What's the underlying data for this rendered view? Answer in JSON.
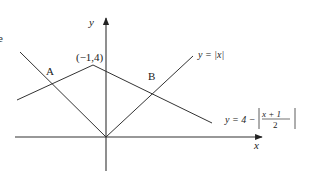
{
  "diagram": {
    "type": "function-graph",
    "axes": {
      "x_label": "x",
      "y_label": "y"
    },
    "points": {
      "A": "A",
      "B": "B",
      "peak": "(−1,4)"
    },
    "curves": [
      {
        "name": "abs-x",
        "label_prefix": "y = ",
        "label_expr": "|x|"
      },
      {
        "name": "tent",
        "label_prefix": "y = 4 − ",
        "numerator": "x + 1",
        "denominator": "2"
      }
    ],
    "edge_fragment": "e",
    "stroke_color": "#333333"
  }
}
